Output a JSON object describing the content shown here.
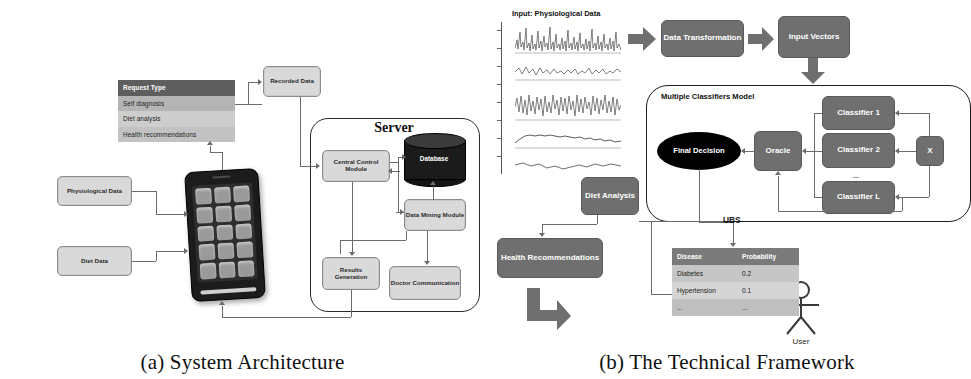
{
  "figure": {
    "panel_a_caption": "(a) System Architecture",
    "panel_b_caption": "(b) The Technical Framework"
  },
  "panel_a": {
    "request_table": {
      "header": "Request Type",
      "rows": [
        "Self diagnosis",
        "Diet analysis",
        "Health recommendations"
      ]
    },
    "inputs": [
      {
        "label": "Physiological Data"
      },
      {
        "label": "Diet Data"
      }
    ],
    "recorded_data": "Recorded Data",
    "server_title": "Server",
    "server_nodes": [
      {
        "label": "Central Control Module"
      },
      {
        "label": "Database"
      },
      {
        "label": "Data Mining Module"
      },
      {
        "label": "Results Generation"
      },
      {
        "label": "Doctor Communication"
      }
    ],
    "device": {
      "name": "smartphone",
      "app_icon_count": 15
    }
  },
  "panel_b": {
    "signal_title": "Input: Physiological Data",
    "signal_plot_count": 5,
    "pipeline": [
      {
        "label": "Data Transformation"
      },
      {
        "label": "Input Vectors"
      }
    ],
    "mcm_title": "Multiple Classifiers Model",
    "final_decision": "Final Decision",
    "oracle": "Oracle",
    "classifiers": [
      "Classifier 1",
      "Classifier 2",
      "Classifier L"
    ],
    "classifier_ellipsis": "...",
    "input_x": "X",
    "diet_analysis": "Diet Analysis",
    "ubs_label": "UBS",
    "health_recommendations": "Health Recommendations",
    "user_label": "User",
    "disease_table": {
      "columns": [
        "Disease",
        "Probability"
      ],
      "rows": [
        [
          "Diabetes",
          "0.2"
        ],
        [
          "Hypertension",
          "0.1"
        ],
        [
          "...",
          "..."
        ]
      ]
    }
  },
  "colors": {
    "dark_node": "#6f6f6f",
    "light_node": "#d9d9d9",
    "table_header": "#5e5e5e",
    "database": "#1b1b1b",
    "connector": "#6b6b6b"
  }
}
